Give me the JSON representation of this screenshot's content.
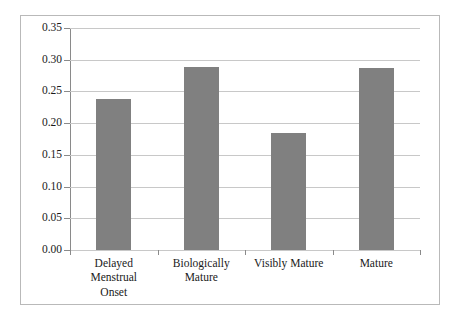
{
  "chart_data": {
    "type": "bar",
    "title": "",
    "subtitle": "",
    "xlabel": "",
    "ylabel": "",
    "categories": [
      "Delayed Menstrual Onset",
      "Biologically Mature",
      "Visibly Mature",
      "Mature"
    ],
    "category_lines": [
      [
        "Delayed Menstrual",
        "Onset"
      ],
      [
        "Biologically",
        "Mature"
      ],
      [
        "Visibly Mature"
      ],
      [
        "Mature"
      ]
    ],
    "values": [
      0.238,
      0.288,
      0.184,
      0.287
    ],
    "ylim": [
      0.0,
      0.35
    ],
    "ytick_labels": [
      "0.00",
      "0.05",
      "0.10",
      "0.15",
      "0.20",
      "0.25",
      "0.30",
      "0.35"
    ],
    "ytick_values": [
      0.0,
      0.05,
      0.1,
      0.15,
      0.2,
      0.25,
      0.3,
      0.35
    ],
    "grid": true,
    "legend": null,
    "legend_position": "none",
    "colors": {
      "bar_fill": "#808080",
      "gridline": "#c8c8c8",
      "axis_line": "#8a8a8a",
      "frame_border": "#b9b9b9",
      "text": "#1a1a1a",
      "background": "#ffffff"
    }
  }
}
